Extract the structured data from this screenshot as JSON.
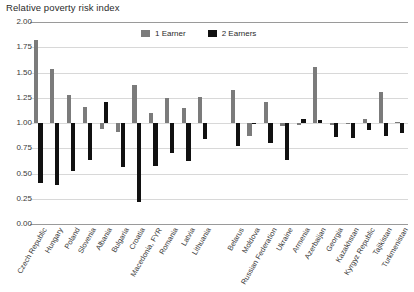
{
  "chart_title": "Relative poverty risk index",
  "legend": {
    "position": "top-center",
    "items": [
      {
        "label": "1 Earner",
        "color": "#7b7b7b",
        "swatch": "legend-swatch-gray"
      },
      {
        "label": "2 Earners",
        "color": "#111111",
        "swatch": "legend-swatch-black"
      }
    ]
  },
  "y_axis": {
    "ticks": [
      "0.00",
      "0.25",
      "0.50",
      "0.75",
      "1.00",
      "1.25",
      "1.50",
      "1.75",
      "2.00"
    ]
  },
  "chart_data": {
    "type": "bar",
    "title": "Relative poverty risk index",
    "xlabel": "",
    "ylabel": "Relative poverty risk index",
    "ylim": [
      0,
      2
    ],
    "ytick_values": [
      0,
      0.25,
      0.5,
      0.75,
      1.0,
      1.25,
      1.5,
      1.75,
      2.0
    ],
    "grid": true,
    "baseline": 1.0,
    "legend_position": "top-center",
    "categories": [
      "Czech Republic",
      "Hungary",
      "Poland",
      "Slovenia",
      "Albania",
      "Bulgaria",
      "Croatia",
      "Macedonia, FYR",
      "Romania",
      "Latvia",
      "Lithuania",
      "Belarus",
      "Moldova",
      "Russian Federation",
      "Ukraine",
      "Armenia",
      "Azerbaijan",
      "Georgia",
      "Kazakhstan",
      "Kyrgyz Republic",
      "Tajikistan",
      "Turkmenistan"
    ],
    "group_break_after": "Lithuania",
    "series": [
      {
        "name": "1 Earner",
        "color": "#7b7b7b",
        "values": [
          1.82,
          1.53,
          1.28,
          1.16,
          0.94,
          0.91,
          1.38,
          1.1,
          1.25,
          1.15,
          1.26,
          1.33,
          0.87,
          1.21,
          0.97,
          0.98,
          1.55,
          0.98,
          1.0,
          1.04,
          1.31,
          1.01
        ]
      },
      {
        "name": "2 Earners",
        "color": "#111111",
        "values": [
          0.41,
          0.39,
          0.52,
          0.63,
          1.21,
          0.56,
          0.22,
          0.57,
          0.7,
          0.62,
          0.84,
          0.77,
          1.0,
          0.8,
          0.63,
          1.04,
          1.03,
          0.86,
          0.85,
          0.93,
          0.87,
          0.9
        ]
      }
    ]
  }
}
